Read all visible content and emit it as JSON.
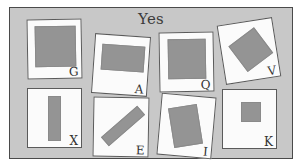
{
  "panel": {
    "title": "Yes",
    "background_color": "#c8c8c8",
    "border_color": "#4a4a4a"
  },
  "palette": {
    "card_background": "#fbfbfb",
    "card_border": "#5a5a5a",
    "shape_fill": "#949494",
    "page_background": "#ffffff",
    "label_color": "#333333"
  },
  "cards": [
    {
      "label": "G",
      "card_rotation_deg": -1,
      "shape": "square",
      "shape_rotation_deg": 0,
      "description": "large gray square"
    },
    {
      "label": "A",
      "card_rotation_deg": 4,
      "shape": "rectangle-wide",
      "shape_rotation_deg": 0,
      "description": "wide gray rectangle"
    },
    {
      "label": "Q",
      "card_rotation_deg": -1,
      "shape": "square",
      "shape_rotation_deg": 0,
      "description": "gray square"
    },
    {
      "label": "V",
      "card_rotation_deg": -9,
      "shape": "square",
      "shape_rotation_deg": -28,
      "description": "rotated gray square (diamond)"
    },
    {
      "label": "X",
      "card_rotation_deg": 0,
      "shape": "bar-vertical",
      "shape_rotation_deg": 0,
      "description": "vertical gray bar"
    },
    {
      "label": "E",
      "card_rotation_deg": 1,
      "shape": "bar-diagonal",
      "shape_rotation_deg": -42,
      "description": "diagonal gray bar"
    },
    {
      "label": "I",
      "card_rotation_deg": 5,
      "shape": "rectangle-tall",
      "shape_rotation_deg": -14,
      "description": "tilted gray rectangle"
    },
    {
      "label": "K",
      "card_rotation_deg": 0,
      "shape": "square-small",
      "shape_rotation_deg": 0,
      "description": "small gray square"
    }
  ]
}
